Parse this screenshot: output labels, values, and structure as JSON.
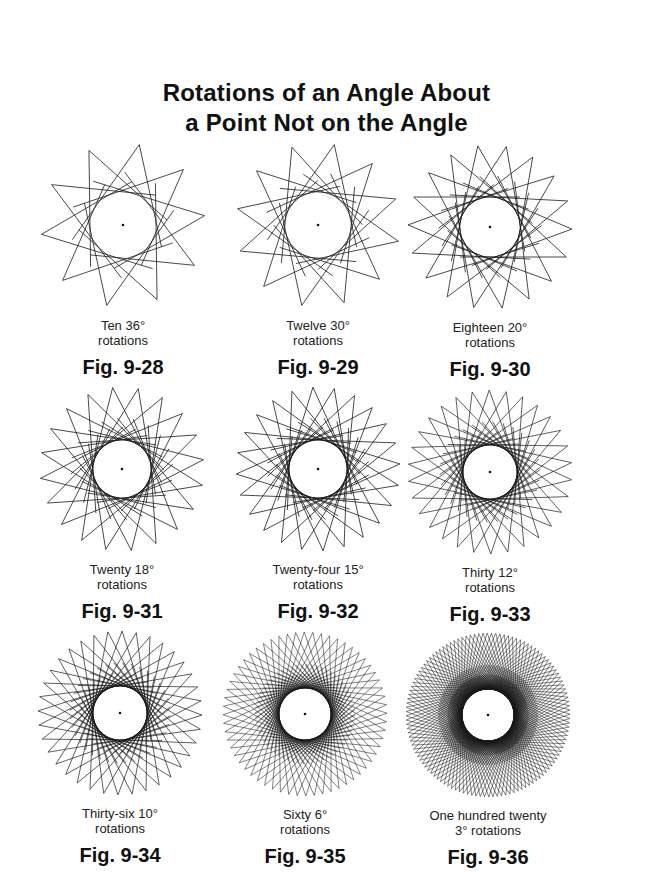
{
  "title": {
    "line1": "Rotations of an Angle About",
    "line2": "a Point Not on the Angle"
  },
  "figures": [
    {
      "caption1": "Ten 36°",
      "caption2": "rotations",
      "label": "Fig. 9-28",
      "n": 10,
      "cx": 123,
      "cy": 225,
      "inner": 33
    },
    {
      "caption1": "Twelve 30°",
      "caption2": "rotations",
      "label": "Fig. 9-29",
      "n": 12,
      "cx": 318,
      "cy": 225,
      "inner": 33
    },
    {
      "caption1": "Eighteen 20°",
      "caption2": "rotations",
      "label": "Fig. 9-30",
      "n": 18,
      "cx": 490,
      "cy": 227,
      "inner": 30
    },
    {
      "caption1": "Twenty 18°",
      "caption2": "rotations",
      "label": "Fig. 9-31",
      "n": 20,
      "cx": 122,
      "cy": 469,
      "inner": 29
    },
    {
      "caption1": "Twenty-four 15°",
      "caption2": "rotations",
      "label": "Fig. 9-32",
      "n": 24,
      "cx": 318,
      "cy": 469,
      "inner": 29
    },
    {
      "caption1": "Thirty 12°",
      "caption2": "rotations",
      "label": "Fig. 9-33",
      "n": 30,
      "cx": 490,
      "cy": 472,
      "inner": 27
    },
    {
      "caption1": "Thirty-six 10°",
      "caption2": "rotations",
      "label": "Fig. 9-34",
      "n": 36,
      "cx": 120,
      "cy": 713,
      "inner": 27
    },
    {
      "caption1": "Sixty 6°",
      "caption2": "rotations",
      "label": "Fig. 9-35",
      "n": 60,
      "cx": 305,
      "cy": 714,
      "inner": 26
    },
    {
      "caption1": "One hundred twenty",
      "caption2": "3° rotations",
      "label": "Fig. 9-36",
      "n": 120,
      "cx": 488,
      "cy": 715,
      "inner": 26
    }
  ],
  "chart_data": {
    "type": "diagram",
    "panels": [
      {
        "label": "Fig. 9-28",
        "rotations": 10,
        "degrees": 36
      },
      {
        "label": "Fig. 9-29",
        "rotations": 12,
        "degrees": 30
      },
      {
        "label": "Fig. 9-30",
        "rotations": 18,
        "degrees": 20
      },
      {
        "label": "Fig. 9-31",
        "rotations": 20,
        "degrees": 18
      },
      {
        "label": "Fig. 9-32",
        "rotations": 24,
        "degrees": 15
      },
      {
        "label": "Fig. 9-33",
        "rotations": 30,
        "degrees": 12
      },
      {
        "label": "Fig. 9-34",
        "rotations": 36,
        "degrees": 10
      },
      {
        "label": "Fig. 9-35",
        "rotations": 60,
        "degrees": 6
      },
      {
        "label": "Fig. 9-36",
        "rotations": 120,
        "degrees": 3
      }
    ]
  }
}
